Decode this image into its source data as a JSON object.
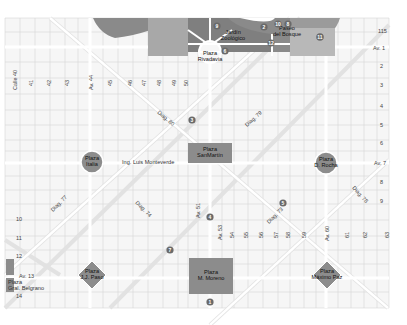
{
  "map": {
    "title": "La Plata city center map",
    "colors": {
      "background": "#ffffff",
      "block_fill": "#f7f7f7",
      "street": "#ffffff",
      "grid_line": "#d9d9d9",
      "plaza_fill": "#8c8c8c",
      "park_dark": "#7a7a7a",
      "park_mid": "#9e9e9e",
      "park_light": "#c4c4c4",
      "marker_fill": "#6a6a6a"
    },
    "plazas": [
      {
        "id": "plaza-rivadavia",
        "line1": "Plaza",
        "line2": "Rivadavia"
      },
      {
        "id": "plaza-italia",
        "line1": "Plaza",
        "line2": "Italia"
      },
      {
        "id": "plaza-san-martin",
        "line1": "Plaza",
        "line2": "SanMartín"
      },
      {
        "id": "plaza-rocha",
        "line1": "Plaza",
        "line2": "D. Rocha"
      },
      {
        "id": "plaza-paso",
        "line1": "Plaza",
        "line2": "J.J. Paso"
      },
      {
        "id": "plaza-moreno",
        "line1": "Plaza",
        "line2": "M. Moreno"
      },
      {
        "id": "plaza-paz",
        "line1": "Plaza",
        "line2": "Máximo Paz"
      },
      {
        "id": "plaza-belgrano",
        "line1": "Plaza",
        "line2": "Gral. Belgrano"
      }
    ],
    "landmarks": [
      {
        "id": "jardin-zoologico",
        "line1": "Jardín",
        "line2": "Zoológico"
      },
      {
        "id": "paseo-del-bosque",
        "line1": "Paseo",
        "line2": "del Bosque"
      },
      {
        "id": "ing-luis-monteverde",
        "label": "Ing. Luis Monteverde"
      }
    ],
    "markers": [
      "1",
      "2",
      "3",
      "4",
      "5",
      "6",
      "7",
      "8",
      "9",
      "10",
      "11",
      "12"
    ],
    "vertical_streets": [
      "Calle 40",
      "41",
      "42",
      "43",
      "Av. 44",
      "45",
      "46",
      "47",
      "48",
      "49",
      "50",
      "Av. 51",
      "Av. 53",
      "54",
      "55",
      "56",
      "57",
      "58",
      "59",
      "Av. 60",
      "61",
      "62",
      "63"
    ],
    "horizontal_streets": [
      "115",
      "Av. 1",
      "2",
      "3",
      "4",
      "5",
      "6",
      "Av. 7",
      "8",
      "9",
      "10",
      "11",
      "12",
      "Av. 13",
      "14"
    ],
    "diagonals": [
      "Diag. 80",
      "Diag. 79",
      "Diag. 77",
      "Diag. 74",
      "Diag. 73",
      "Diag. 78"
    ]
  }
}
